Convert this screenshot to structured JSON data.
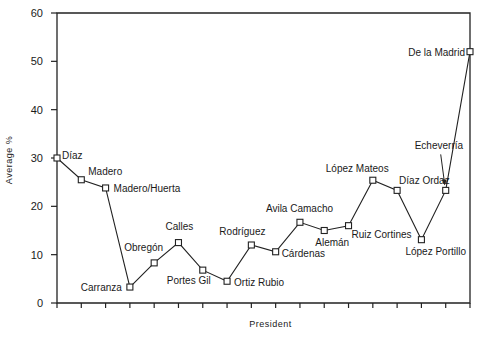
{
  "chart_data": {
    "type": "line",
    "title": "",
    "xlabel": "President",
    "ylabel": "Average %",
    "ylim": [
      0,
      60
    ],
    "yticks": [
      0,
      10,
      20,
      30,
      40,
      50,
      60
    ],
    "grid": false,
    "legend": null,
    "categories": [
      "Díaz",
      "Madero",
      "Madero/Huerta",
      "Carranza",
      "Obregón",
      "Calles",
      "Portes Gil",
      "Ortiz Rubio",
      "Rodríguez",
      "Cárdenas",
      "Avila Camacho",
      "Alemán",
      "Ruiz Cortines",
      "López Mateos",
      "Díaz Ordaz",
      "Echeverría",
      "López Portillo",
      "De la Madrid"
    ],
    "plot_order": [
      "Díaz",
      "Madero",
      "Madero/Huerta",
      "Carranza",
      "Obregón",
      "Calles",
      "Portes Gil",
      "Ortiz Rubio",
      "Rodríguez",
      "Cárdenas",
      "Avila Camacho",
      "Alemán",
      "Ruiz Cortines",
      "López Mateos",
      "Díaz Ordaz",
      "López Portillo",
      "Echeverría",
      "De la Madrid"
    ],
    "series": [
      {
        "name": "Average %",
        "points": [
          {
            "label": "Díaz",
            "value": 30.0
          },
          {
            "label": "Madero",
            "value": 25.5
          },
          {
            "label": "Madero/Huerta",
            "value": 23.8
          },
          {
            "label": "Carranza",
            "value": 3.3
          },
          {
            "label": "Obregón",
            "value": 8.3
          },
          {
            "label": "Calles",
            "value": 12.5
          },
          {
            "label": "Portes Gil",
            "value": 6.8
          },
          {
            "label": "Ortiz Rubio",
            "value": 4.5
          },
          {
            "label": "Rodríguez",
            "value": 12.0
          },
          {
            "label": "Cárdenas",
            "value": 10.6
          },
          {
            "label": "Avila Camacho",
            "value": 16.7
          },
          {
            "label": "Alemán",
            "value": 15.0
          },
          {
            "label": "Ruiz Cortines",
            "value": 16.0
          },
          {
            "label": "López Mateos",
            "value": 25.4
          },
          {
            "label": "Díaz Ordaz",
            "value": 23.3
          },
          {
            "label": "López Portillo",
            "value": 13.1
          },
          {
            "label": "Echeverría",
            "value": 23.3
          },
          {
            "label": "De la Madrid",
            "value": 52.0
          }
        ]
      }
    ]
  },
  "labels": {
    "xlabel": "President",
    "ylabel": "Average %"
  }
}
